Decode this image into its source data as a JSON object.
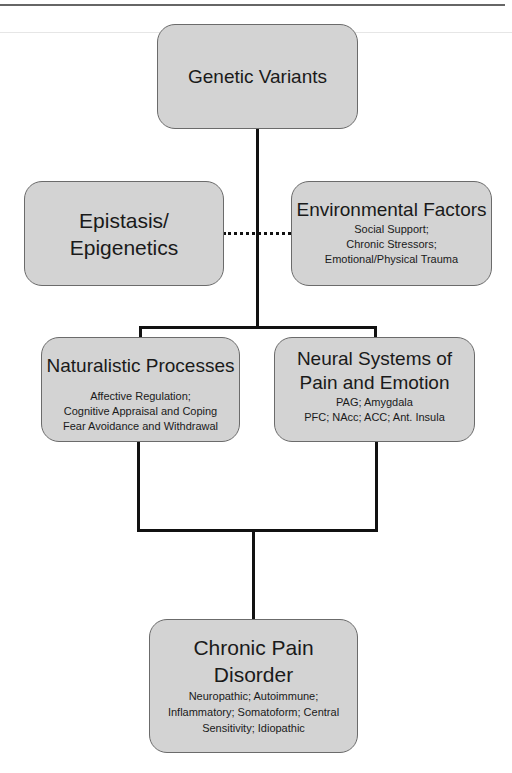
{
  "diagram": {
    "nodes": {
      "genetic_variants": {
        "title": "Genetic Variants"
      },
      "epistasis": {
        "title_line1": "Epistasis/",
        "title_line2": "Epigenetics"
      },
      "environmental": {
        "title": "Environmental Factors",
        "details": [
          "Social Support;",
          "Chronic Stressors;",
          "Emotional/Physical Trauma"
        ]
      },
      "naturalistic": {
        "title": "Naturalistic Processes",
        "details": [
          "Affective Regulation;",
          "Cognitive Appraisal and Coping",
          "Fear Avoidance and Withdrawal"
        ]
      },
      "neural": {
        "title_line1": "Neural Systems of",
        "title_line2": "Pain and Emotion",
        "details": [
          "PAG; Amygdala",
          "PFC; NAcc; ACC; Ant. Insula"
        ]
      },
      "chronic_pain": {
        "title_line1": "Chronic Pain",
        "title_line2": "Disorder",
        "details": [
          "Neuropathic; Autoimmune;",
          "Inflammatory; Somatoform; Central",
          "Sensitivity; Idiopathic"
        ]
      }
    },
    "edges": [
      {
        "from": "Genetic Variants",
        "to": [
          "Naturalistic Processes",
          "Neural Systems of Pain and Emotion"
        ],
        "style": "solid"
      },
      {
        "from": "Epistasis/Epigenetics",
        "to": "Environmental Factors",
        "style": "dotted"
      },
      {
        "from": [
          "Naturalistic Processes",
          "Neural Systems of Pain and Emotion"
        ],
        "to": "Chronic Pain Disorder",
        "style": "solid"
      }
    ],
    "colors": {
      "box_fill": "#d3d3d3",
      "box_border": "#6b6b6b",
      "line": "#111111"
    }
  }
}
